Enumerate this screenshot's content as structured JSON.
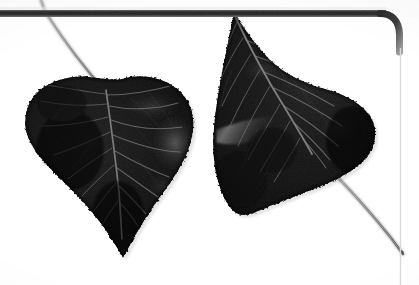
{
  "image": {
    "kind": "natural-image",
    "subject": "two-leaves-botanical-specimen",
    "caption": "Two broad cordate poplar/cottonwood leaves photographed in grayscale on a white background",
    "orientation": "landscape",
    "width_px": 419,
    "height_px": 285,
    "color_mode": "grayscale"
  },
  "palette": {
    "background": "#fdfdfd",
    "paper_white": "#ffffff",
    "leaf_darkest": "#0b0b0b",
    "leaf_dark": "#161616",
    "leaf_mid": "#2c2c2c",
    "leaf_light": "#4a4a4a",
    "vein_light": "#7d7d7d",
    "vein_bright": "#a8a8a8",
    "highlight_gray": "#6e6e6e",
    "frame_dark": "#3a3a3a",
    "frame_darkest": "#262626",
    "frame_light_line": "#d9d9d9",
    "petiole_gray": "#8f8f8f",
    "petiole_dark": "#6a6a6a"
  },
  "frame": {
    "label": "rounded-border-frame",
    "top_bar": {
      "y": 10,
      "height": 7,
      "x_start": 0,
      "x_end": 385,
      "color": "#2f2f2f"
    },
    "corner": {
      "cx": 385,
      "cy": 48,
      "radius": 38,
      "position": "top-right"
    },
    "right_line": {
      "x": 400,
      "y_start": 48,
      "y_end": 285,
      "color": "#d9d9d9",
      "width": 1
    }
  },
  "objects": [
    {
      "name": "leaf-left",
      "shape": "cordate",
      "margin": "serrate-crenate",
      "apex": "acuminate-drip-tip",
      "apex_point": {
        "x": 123,
        "y": 257
      },
      "bounds": {
        "x": 25,
        "y": 74,
        "w": 170,
        "h": 183
      },
      "rotation_deg": 4,
      "tone": "very-dark",
      "vein_count": 9,
      "petiole": {
        "name": "petiole-left",
        "from": {
          "x": 105,
          "y": 90
        },
        "to": {
          "x": 42,
          "y": 0
        },
        "curve": "concave-left",
        "color": "#8f8f8f"
      }
    },
    {
      "name": "leaf-right",
      "shape": "ovate-cordate",
      "margin": "serrate-crenate",
      "apex": "acuminate",
      "apex_point": {
        "x": 234,
        "y": 12
      },
      "bounds": {
        "x": 213,
        "y": 12,
        "w": 163,
        "h": 204
      },
      "rotation_deg": -38,
      "tone": "very-dark",
      "vein_count": 9,
      "petiole": {
        "name": "petiole-right",
        "from": {
          "x": 313,
          "y": 156
        },
        "to": {
          "x": 401,
          "y": 252
        },
        "curve": "convex-up",
        "color": "#8f8f8f"
      }
    }
  ],
  "highlights": [
    {
      "name": "specular-highlight-left-leaf",
      "x": 168,
      "y": 140,
      "w": 26,
      "h": 34,
      "tone": "#5c5c5c"
    },
    {
      "name": "specular-streak-right-leaf",
      "x": 228,
      "y": 118,
      "w": 54,
      "h": 20,
      "tone": "#6e6e6e"
    },
    {
      "name": "specular-patch-right-leaf-upper",
      "x": 280,
      "y": 38,
      "w": 48,
      "h": 26,
      "tone": "#4a4a4a"
    }
  ]
}
